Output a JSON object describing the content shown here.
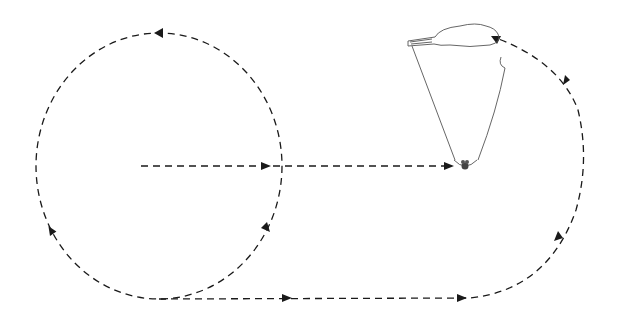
{
  "diagram": {
    "colors": {
      "background": "#ffffff",
      "stroke": "#1a1a1a",
      "canopy": "#555555"
    },
    "paths": [
      {
        "id": "circle-loop",
        "type": "dashed-circle",
        "direction": "counter-clockwise"
      },
      {
        "id": "center-to-pilot",
        "type": "dashed-line",
        "direction": "right"
      },
      {
        "id": "bottom-return",
        "type": "dashed-line",
        "direction": "right"
      },
      {
        "id": "right-arc",
        "type": "dashed-arc",
        "direction": "upward to canopy"
      }
    ],
    "figures": [
      {
        "id": "canopy",
        "label": ""
      },
      {
        "id": "pilot",
        "label": ""
      }
    ]
  }
}
